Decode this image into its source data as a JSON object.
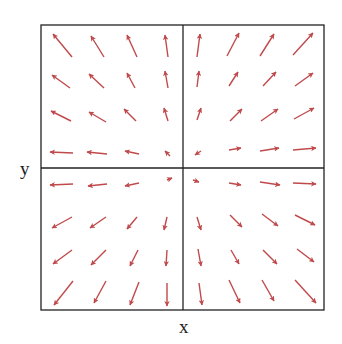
{
  "chart_data": {
    "type": "quiver",
    "title": "",
    "xlabel": "x",
    "ylabel": "y",
    "grid": false,
    "axes_lines": "cross through origin",
    "arrow_color": "#c0494b",
    "frame_color": "#222222",
    "frame": {
      "left": 41,
      "top": 25,
      "right": 324,
      "bottom": 310
    },
    "origin": {
      "x": 183,
      "y": 168
    },
    "arrows": [
      [
        72,
        57,
        53,
        34
      ],
      [
        104,
        57,
        91,
        36
      ],
      [
        137,
        57,
        127,
        35
      ],
      [
        168,
        57,
        165,
        35
      ],
      [
        197,
        57,
        200,
        34
      ],
      [
        227,
        56,
        239,
        33
      ],
      [
        260,
        56,
        274,
        34
      ],
      [
        293,
        55,
        313,
        33
      ],
      [
        70,
        88,
        52,
        75
      ],
      [
        104,
        88,
        89,
        74
      ],
      [
        135,
        88,
        127,
        73
      ],
      [
        168,
        88,
        165,
        71
      ],
      [
        197,
        87,
        199,
        71
      ],
      [
        229,
        86,
        238,
        72
      ],
      [
        263,
        86,
        276,
        72
      ],
      [
        295,
        86,
        313,
        73
      ],
      [
        71,
        121,
        51,
        111
      ],
      [
        106,
        122,
        89,
        112
      ],
      [
        136,
        121,
        124,
        109
      ],
      [
        168,
        121,
        164,
        108
      ],
      [
        197,
        120,
        201,
        108
      ],
      [
        230,
        121,
        242,
        109
      ],
      [
        261,
        121,
        278,
        109
      ],
      [
        294,
        119,
        314,
        108
      ],
      [
        73,
        153,
        50,
        152
      ],
      [
        107,
        154,
        87,
        152
      ],
      [
        139,
        154,
        125,
        151
      ],
      [
        170,
        156,
        165,
        151
      ],
      [
        201,
        151,
        195,
        155
      ],
      [
        229,
        150,
        241,
        148
      ],
      [
        260,
        151,
        279,
        148
      ],
      [
        293,
        150,
        316,
        148
      ],
      [
        73,
        184,
        50,
        185
      ],
      [
        107,
        184,
        88,
        186
      ],
      [
        139,
        183,
        125,
        186
      ],
      [
        167,
        180,
        172,
        178
      ],
      [
        193,
        180,
        199,
        182
      ],
      [
        229,
        183,
        241,
        185
      ],
      [
        260,
        182,
        280,
        185
      ],
      [
        293,
        183,
        316,
        184
      ],
      [
        72,
        217,
        52,
        228
      ],
      [
        106,
        217,
        90,
        228
      ],
      [
        137,
        217,
        127,
        229
      ],
      [
        167,
        217,
        164,
        230
      ],
      [
        197,
        217,
        201,
        230
      ],
      [
        230,
        215,
        242,
        227
      ],
      [
        262,
        214,
        278,
        226
      ],
      [
        295,
        215,
        315,
        225
      ],
      [
        72,
        250,
        53,
        264
      ],
      [
        106,
        250,
        91,
        265
      ],
      [
        138,
        250,
        130,
        266
      ],
      [
        167,
        250,
        166,
        266
      ],
      [
        198,
        249,
        201,
        266
      ],
      [
        231,
        250,
        239,
        264
      ],
      [
        263,
        250,
        277,
        264
      ],
      [
        297,
        249,
        314,
        262
      ],
      [
        73,
        281,
        54,
        305
      ],
      [
        106,
        281,
        94,
        303
      ],
      [
        139,
        282,
        130,
        305
      ],
      [
        167,
        283,
        167,
        306
      ],
      [
        199,
        283,
        202,
        305
      ],
      [
        229,
        280,
        240,
        303
      ],
      [
        262,
        280,
        274,
        301
      ],
      [
        295,
        280,
        316,
        303
      ]
    ]
  },
  "labels": {
    "x_axis": "x",
    "y_axis": "y"
  }
}
